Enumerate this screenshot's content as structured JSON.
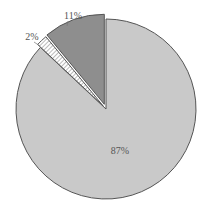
{
  "chart_data": {
    "type": "pie",
    "title": "",
    "categories": [
      "87%",
      "2%",
      "11%"
    ],
    "values": [
      87,
      2,
      11
    ],
    "labels": [
      "87%",
      "2%",
      "11%"
    ],
    "colors": [
      "#c9c9c9",
      "#ffffff",
      "#8e8e8e"
    ],
    "patterns": [
      "solid",
      "hatched",
      "solid"
    ],
    "exploded": [
      false,
      true,
      true
    ],
    "start_angle_deg": 0,
    "direction": "clockwise",
    "legend": "none"
  }
}
